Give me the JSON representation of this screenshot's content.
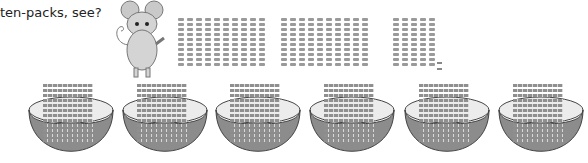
{
  "caption": "ten-packs, see?",
  "character": "mouse-icon",
  "packs": {
    "groups": [
      {
        "tens": 10,
        "left": 178
      },
      {
        "tens": 10,
        "left": 281
      },
      {
        "tens": 5,
        "left": 393
      }
    ],
    "singles": 2,
    "per_pack": 10,
    "total": 252
  },
  "bowls": [
    {
      "left": 27,
      "rows": 12
    },
    {
      "left": 121,
      "rows": 12
    },
    {
      "left": 214,
      "rows": 12
    },
    {
      "left": 308,
      "rows": 12
    },
    {
      "left": 403,
      "rows": 12
    },
    {
      "left": 497,
      "rows": 12
    }
  ],
  "colors": {
    "bowl_outer": "#8c8c8c",
    "bowl_inner": "#ececec",
    "stick": "#9a9a9a"
  }
}
